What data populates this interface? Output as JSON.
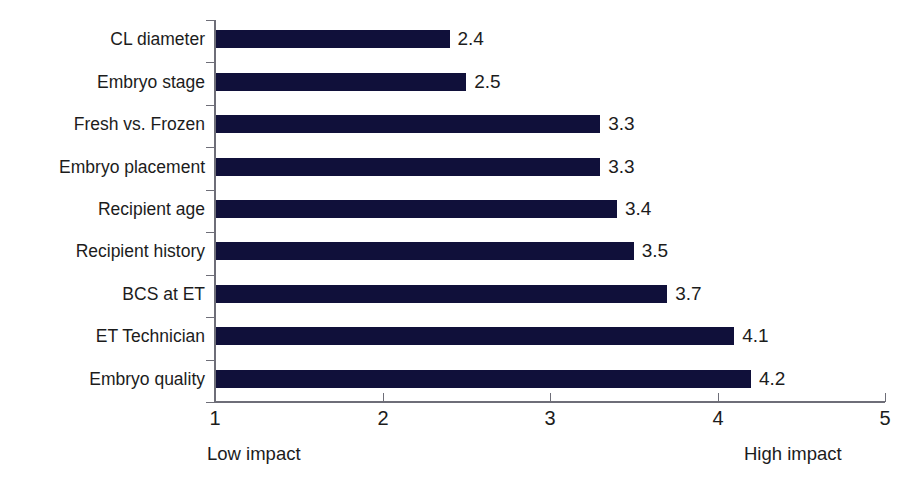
{
  "chart_data": {
    "type": "bar",
    "orientation": "horizontal",
    "title": "",
    "subtitle": "",
    "xlabel": "",
    "ylabel": "",
    "categories": [
      "CL diameter",
      "Embryo stage",
      "Fresh vs. Frozen",
      "Embryo placement",
      "Recipient age",
      "Recipient history",
      "BCS at ET",
      "ET Technician",
      "Embryo quality"
    ],
    "values": [
      2.4,
      2.5,
      3.3,
      3.3,
      3.4,
      3.5,
      3.7,
      4.1,
      4.2
    ],
    "value_labels": [
      "2.4",
      "2.5",
      "3.3",
      "3.3",
      "3.4",
      "3.5",
      "3.7",
      "4.1",
      "4.2"
    ],
    "xlim": [
      1,
      5
    ],
    "xticks": [
      1,
      2,
      3,
      4,
      5
    ],
    "xtick_labels": [
      "1",
      "2",
      "3",
      "4",
      "5"
    ],
    "grid": false,
    "legend": null,
    "bar_color": "#10103a",
    "axis_color": "#6e6e78",
    "text_color": "#1c1c1c",
    "annotations": {
      "axis_low": "Low impact",
      "axis_high": "High impact"
    }
  }
}
